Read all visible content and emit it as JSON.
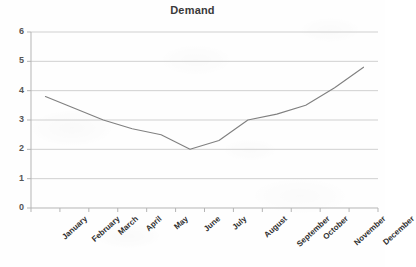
{
  "chart_data": {
    "type": "line",
    "title": "Demand",
    "xlabel": "",
    "ylabel": "",
    "categories": [
      "January",
      "February",
      "March",
      "April",
      "May",
      "June",
      "July",
      "August",
      "September",
      "October",
      "November",
      "December"
    ],
    "values": [
      3.8,
      3.4,
      3.0,
      2.7,
      2.5,
      2.0,
      2.3,
      3.0,
      3.2,
      3.5,
      4.1,
      4.8
    ],
    "series": [
      {
        "name": "Demand",
        "values": [
          3.8,
          3.4,
          3.0,
          2.7,
          2.5,
          2.0,
          2.3,
          3.0,
          3.2,
          3.5,
          4.1,
          4.8
        ]
      }
    ],
    "ylim": [
      0,
      6
    ],
    "yticks": [
      0,
      1,
      2,
      3,
      4,
      5,
      6
    ],
    "ytick_labels": [
      "0",
      "1",
      "2",
      "3",
      "4",
      "5",
      "6"
    ],
    "grid": true,
    "grid_axis": "y",
    "legend": false,
    "legend_position": "none",
    "line_color": "#808080",
    "grid_color": "#d0d0d0",
    "axis_color": "#b5b5b5",
    "title_color": "#3a3a3a",
    "tick_label_color": "#555555",
    "category_label_color": "#2e2e2e",
    "background_color": "#ffffff",
    "marker": "none",
    "line_width": 1
  }
}
